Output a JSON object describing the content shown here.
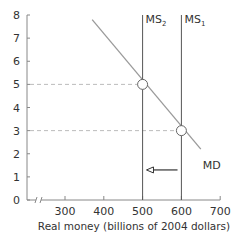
{
  "chart_data": {
    "type": "line",
    "title": "Interest rate (per cent per year)",
    "ylabel": "Interest rate (per cent per year)",
    "xlabel": "Real money (billions of 2004 dollars)",
    "xlim": [
      250,
      700
    ],
    "ylim": [
      0,
      8
    ],
    "x_axis_break": true,
    "xticks": [
      300,
      400,
      500,
      600,
      700
    ],
    "xtick_labels": [
      "300",
      "400",
      "500",
      "600",
      "700"
    ],
    "yticks": [
      0,
      1,
      2,
      3,
      4,
      5,
      6,
      7,
      8
    ],
    "ytick_labels": [
      "0",
      "1",
      "2",
      "3",
      "4",
      "5",
      "6",
      "7",
      "8"
    ],
    "grid": false,
    "series": [
      {
        "name": "MD",
        "kind": "demand",
        "points": [
          [
            370,
            7.8
          ],
          [
            650,
            2.2
          ]
        ],
        "color": "#9a9a9a"
      },
      {
        "name": "MS1",
        "label_main": "MS",
        "label_sub": "1",
        "kind": "vertical",
        "x": 600,
        "y_range": [
          0,
          8
        ],
        "color": "#555555"
      },
      {
        "name": "MS2",
        "label_main": "MS",
        "label_sub": "2",
        "kind": "vertical",
        "x": 500,
        "y_range": [
          0,
          8
        ],
        "color": "#555555"
      }
    ],
    "equilibria": [
      {
        "x": 500,
        "y": 5
      },
      {
        "x": 600,
        "y": 3
      }
    ],
    "guides": [
      {
        "y": 5,
        "x_to": 500
      },
      {
        "y": 3,
        "x_to": 600
      }
    ],
    "annotations": [
      {
        "type": "arrow",
        "from_x": 590,
        "to_x": 510,
        "y": 1.3,
        "meaning": "money supply shift left"
      }
    ],
    "colors": {
      "axis": "#888888",
      "text": "#333333",
      "guide": "#bbbbbb",
      "marker_fill": "#ffffff",
      "marker_stroke": "#666666"
    }
  }
}
